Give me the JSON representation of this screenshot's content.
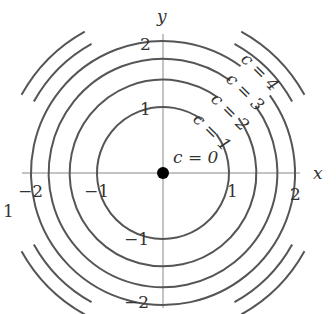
{
  "axes": {
    "x_label": "x",
    "y_label": "y",
    "x_ticks": [
      "−2",
      "−1",
      "1",
      "2"
    ],
    "y_ticks": [
      "2",
      "1",
      "−1",
      "−2"
    ],
    "x_tick_values": [
      -2,
      -1,
      1,
      2
    ],
    "y_tick_values": [
      2,
      1,
      -1,
      -2
    ]
  },
  "level_curves": [
    {
      "label": "c = 0",
      "c": 0
    },
    {
      "label": "c = 1",
      "c": 1
    },
    {
      "label": "c = 2",
      "c": 2
    },
    {
      "label": "c = 3",
      "c": 3
    },
    {
      "label": "c = 4",
      "c": 4
    }
  ],
  "outer_arcs_c": [
    5,
    6
  ],
  "stray_label": "1",
  "colors": {
    "curve": "#555555",
    "axis": "#888888",
    "point": "#000000"
  }
}
